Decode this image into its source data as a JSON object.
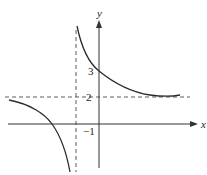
{
  "diagram": {
    "type": "function-graph",
    "axes": {
      "x_label": "x",
      "y_label": "y"
    },
    "tick_labels": {
      "y_intercept": "3",
      "horizontal_asymptote": "2",
      "vertical_asymptote": "−1"
    },
    "asymptotes": {
      "vertical": -1,
      "horizontal": 2
    },
    "colors": {
      "curve": "#2a2a2a",
      "axis": "#333333",
      "asymptote": "#333333"
    }
  }
}
